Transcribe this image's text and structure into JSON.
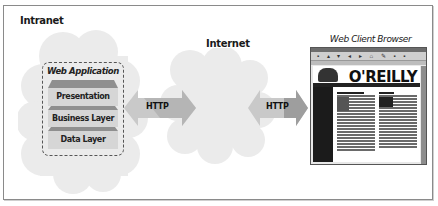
{
  "diagram": {
    "regions": {
      "intranet": {
        "label": "Intranet"
      },
      "internet": {
        "label": "Internet"
      },
      "client": {
        "label": "Web Client Browser"
      }
    },
    "web_application": {
      "title": "Web Application",
      "layers": [
        {
          "label": "Presentation Layer"
        },
        {
          "label": "Business Layer"
        },
        {
          "label": "Data Layer"
        }
      ]
    },
    "connections": [
      {
        "label": "HTTP",
        "from": "Intranet",
        "to": "Internet"
      },
      {
        "label": "HTTP",
        "from": "Internet",
        "to": "Web Client Browser"
      }
    ],
    "browser_screenshot": {
      "logo_text": "O'REILLY"
    }
  },
  "colors": {
    "cloud": "#ebebeb",
    "layer_fill": "#d6d6d6",
    "layer_cap": "#8f8f8f",
    "arrow_light": "#c9c9c9",
    "arrow_dark": "#9e9e9e",
    "frame_border": "#8a8a8a"
  }
}
